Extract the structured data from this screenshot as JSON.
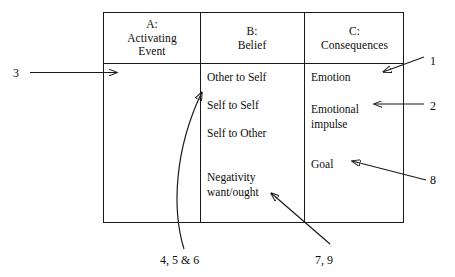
{
  "diagram": {
    "title_columns": [
      {
        "id": "A",
        "label_line1": "A:",
        "label_line2": "Activating",
        "label_line3": "Event"
      },
      {
        "id": "B",
        "label_line1": "B:",
        "label_line2": "Belief"
      },
      {
        "id": "C",
        "label_line1": "C:",
        "label_line2": "Consequences"
      }
    ],
    "column_a_items": [],
    "column_b_items": [
      {
        "text": "Other to Self"
      },
      {
        "text": "Self to Self"
      },
      {
        "text": "Self to Other"
      },
      {
        "text": "Negativity"
      },
      {
        "text": "want/ought"
      }
    ],
    "column_c_items": [
      {
        "text": "Emotion"
      },
      {
        "text": "Emotional"
      },
      {
        "text": "impulse"
      },
      {
        "text": "Goal"
      }
    ],
    "callouts": [
      {
        "id": "left",
        "label": "3"
      },
      {
        "id": "right-1",
        "label": "1"
      },
      {
        "id": "right-2",
        "label": "2"
      },
      {
        "id": "right-8",
        "label": "8"
      },
      {
        "id": "bottom-left",
        "label": "4, 5 & 6"
      },
      {
        "id": "bottom-right",
        "label": "7, 9"
      }
    ],
    "colors": {
      "stroke": "#1a1a1a",
      "text": "#0d0d0d",
      "background": "#ffffff"
    }
  }
}
